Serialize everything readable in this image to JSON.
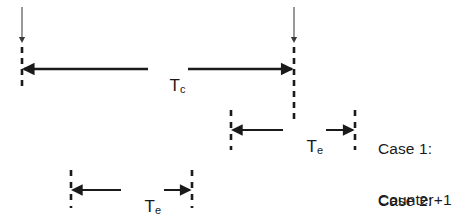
{
  "figure": {
    "type": "timing-diagram",
    "background_color": "#ffffff",
    "stroke_color": "#1a1a1a",
    "thin_stroke_color": "#5a5a5a",
    "width": 465,
    "height": 217
  },
  "measures": {
    "tc": {
      "symbol": "T",
      "subscript": "c",
      "full_label": "Tc",
      "description": "clock period measure between the two event edges",
      "start_x": 22,
      "end_x": 294,
      "y": 69
    },
    "te_case1": {
      "symbol": "T",
      "subscript": "e",
      "full_label": "Te",
      "description": "enable window that overlaps the second edge",
      "start_x": 231,
      "end_x": 355,
      "y": 130
    },
    "te_case2": {
      "symbol": "T",
      "subscript": "e",
      "full_label": "Te",
      "description": "enable window that does not reach the second edge",
      "start_x": 71,
      "end_x": 192,
      "y": 190
    }
  },
  "edges": {
    "left_edge": {
      "name": "first-event-edge",
      "x": 22,
      "top_y": 7,
      "arrow_y": 44,
      "dash_bottom_y": 86
    },
    "right_edge": {
      "name": "second-event-edge",
      "x": 294,
      "top_y": 7,
      "arrow_y": 44,
      "dash_bottom_y": 120
    }
  },
  "cases": [
    {
      "id": "case-1",
      "title": "Case 1:",
      "result": "Counter+1",
      "x": 378,
      "y": 110
    },
    {
      "id": "case-2",
      "title": "Case 2:",
      "result": "Counter+0",
      "x": 378,
      "y": 162
    }
  ]
}
